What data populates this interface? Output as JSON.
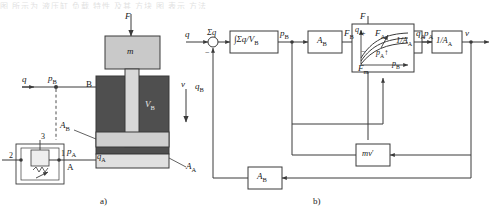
{
  "figure": {
    "top_cropped_text": "图 所示为 液压缸 负载 特性 及其 方块 图 表示 方法",
    "caption_a": "a)",
    "caption_b": "b)"
  },
  "schematic": {
    "force_label": "F",
    "mass_label": "m",
    "velocity_label": "v",
    "flow_in_label": "q",
    "pressure_b_label": "p",
    "pressure_b_sub": "B",
    "port_b_label": "B",
    "port_a_label": "A",
    "volume_b_label": "V",
    "volume_b_sub": "B",
    "area_b_label": "A",
    "area_b_sub": "B",
    "area_a_label": "A",
    "area_a_sub": "A",
    "pressure_a_label": "p",
    "pressure_a_sub": "A",
    "flow_a_label": "q",
    "flow_a_sub": "A",
    "valve_port_1": "1",
    "valve_port_2": "2",
    "valve_port_3": "3"
  },
  "block_diagram": {
    "input_q": "q",
    "sum_left_output": "Σq",
    "feedback_qb": "q",
    "feedback_qb_sub": "B",
    "block_integrator": "∫Σq/V",
    "block_integrator_sub": "B",
    "signal_pb": "p",
    "signal_pb_sub": "B",
    "block_ab": "A",
    "block_ab_sub": "B",
    "signal_fb": "F",
    "signal_fb_sub": "B",
    "input_f": "F",
    "sign_plus": "+",
    "sign_minus": "−",
    "feedback_fm": "F",
    "feedback_fm_sub": "m",
    "signal_fa": "F",
    "signal_fa_sub": "A",
    "block_inv_aa_1": "1/A",
    "block_inv_aa_1_sub": "A",
    "signal_pa": "p",
    "signal_pa_sub": "A",
    "curve_y_axis": "q",
    "curve_y_axis_sub": "A",
    "curve_x_axis": "p",
    "curve_x_axis_sub": "B",
    "curve_param": "p",
    "curve_param_sub": "A",
    "curve_param_arrow": "↑",
    "signal_qa": "q",
    "signal_qa_sub": "A",
    "block_inv_aa_2": "1/A",
    "block_inv_aa_2_sub": "A",
    "output_v": "v",
    "block_mv": "mv",
    "block_mv_prime": "′",
    "block_ab_feedback": "A",
    "block_ab_feedback_sub": "B"
  },
  "colors": {
    "line": "#3a3a3a",
    "cylinder_dark": "#4f4f4f",
    "cylinder_mid": "#8e8e8e",
    "mass_fill": "#c9c9c9",
    "rod_fill": "#d8d8d8",
    "piston_fill": "#cfcfcf",
    "valve_fill": "#e2e2e2",
    "block_fill": "#ffffff"
  }
}
